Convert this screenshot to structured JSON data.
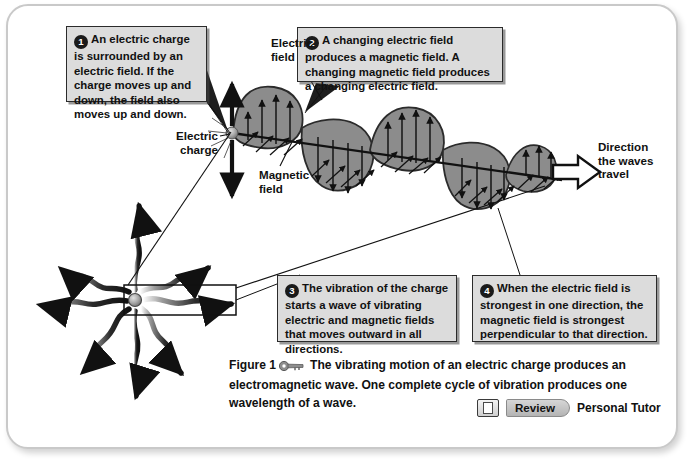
{
  "figure": {
    "frame_color": "#c9c9c9",
    "background": "#ffffff"
  },
  "callouts": [
    {
      "number": "1",
      "text": "An electric charge is surrounded by an electric field. If the charge moves up and down, the field also moves up and down."
    },
    {
      "number": "2",
      "text": "A changing electric field produces a magnetic field. A changing magnetic field produces a changing electric field."
    },
    {
      "number": "3",
      "text": "The vibration of the charge starts a wave of vibrating electric and magnetic fields that moves outward in all directions."
    },
    {
      "number": "4",
      "text": "When the electric field is strongest in one direction, the magnetic field is strongest perpendicular to that direction."
    }
  ],
  "labels": {
    "electric_field": "Electric field",
    "electric_charge": "Electric charge",
    "magnetic_field": "Magnetic field",
    "direction": "Direction the waves travel"
  },
  "caption": {
    "figure_number": "Figure 1",
    "key_icon": "key-icon",
    "body": "The vibrating motion of an electric charge produces an electromagnetic wave. One complete cycle of vibration produces one wavelength of a wave."
  },
  "footer": {
    "review_icon": "review-page-icon",
    "review_label": "Review",
    "personal_tutor_label": "Personal Tutor"
  },
  "diagram": {
    "charge_color": "#9a9a9a",
    "lobe_fill": "#8c8c8c",
    "lobe_stroke": "#2b2b2b",
    "arrow_color": "#111111",
    "wave_lobes": 7,
    "radiating_arrows": 8,
    "vertical_arrow_label": "electric-field-oscillation-arrow",
    "travel_arrow_label": "wave-travel-arrow",
    "highlight_box_label": "magnified-region-box"
  }
}
